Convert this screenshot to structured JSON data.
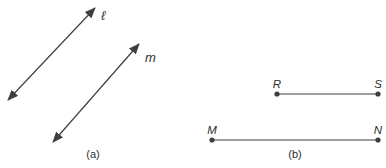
{
  "figure": {
    "background_color": "#ffffff",
    "stroke_color": "#3f3f3f",
    "text_color": "#2e2e2e",
    "width": 386,
    "height": 168,
    "panels": [
      {
        "id": "a",
        "caption": "(a)",
        "caption_x": 93,
        "caption_y": 158,
        "lines": [
          {
            "label": "ℓ",
            "x1": 8,
            "y1": 100,
            "x2": 95,
            "y2": 8,
            "label_x": 101,
            "label_y": 20
          },
          {
            "label": "m",
            "x1": 53,
            "y1": 142,
            "x2": 139,
            "y2": 44,
            "label_x": 145,
            "label_y": 62
          }
        ]
      },
      {
        "id": "b",
        "caption": "(b)",
        "caption_x": 295,
        "caption_y": 158,
        "segments": [
          {
            "y": 94,
            "label_y": 88,
            "p1": {
              "label": "R",
              "x": 277
            },
            "p2": {
              "label": "S",
              "x": 378
            }
          },
          {
            "y": 140,
            "label_y": 134,
            "p1": {
              "label": "M",
              "x": 212
            },
            "p2": {
              "label": "N",
              "x": 378
            }
          }
        ]
      }
    ]
  }
}
